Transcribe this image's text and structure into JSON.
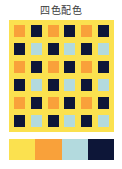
{
  "page": {
    "title": "四色配色",
    "background": "#ffffff"
  },
  "colors": {
    "yellow": "#fbe14f",
    "orange": "#f9a13a",
    "lightblue": "#b3dade",
    "navy": "#0d1638"
  },
  "grid": {
    "rows": 6,
    "cols": 6,
    "background": "#fbe14f",
    "cells": [
      [
        "#f9a13a",
        "#0d1638",
        "#f9a13a",
        "#0d1638",
        "#f9a13a",
        "#0d1638"
      ],
      [
        "#0d1638",
        "#b3dade",
        "#0d1638",
        "#b3dade",
        "#0d1638",
        "#b3dade"
      ],
      [
        "#f9a13a",
        "#0d1638",
        "#f9a13a",
        "#0d1638",
        "#f9a13a",
        "#0d1638"
      ],
      [
        "#0d1638",
        "#b3dade",
        "#0d1638",
        "#b3dade",
        "#0d1638",
        "#b3dade"
      ],
      [
        "#f9a13a",
        "#0d1638",
        "#f9a13a",
        "#0d1638",
        "#f9a13a",
        "#0d1638"
      ],
      [
        "#0d1638",
        "#b3dade",
        "#0d1638",
        "#b3dade",
        "#0d1638",
        "#b3dade"
      ]
    ]
  },
  "palette": {
    "swatches": [
      {
        "name": "yellow",
        "color": "#fbe14f"
      },
      {
        "name": "orange",
        "color": "#f9a13a"
      },
      {
        "name": "light-blue",
        "color": "#b3dade"
      },
      {
        "name": "navy",
        "color": "#0d1638"
      }
    ]
  }
}
